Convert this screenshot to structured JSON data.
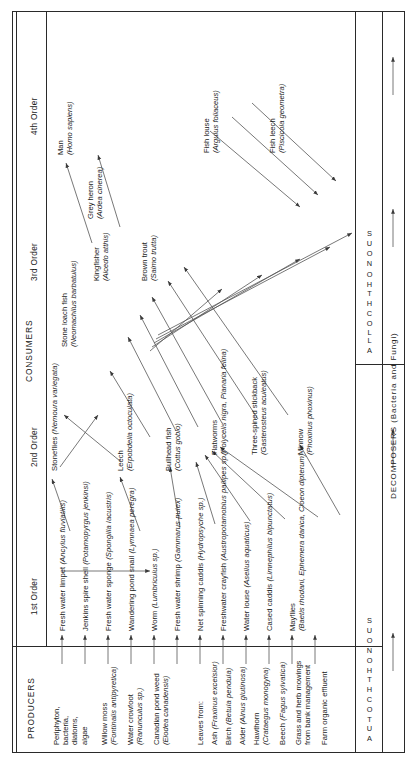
{
  "figure": {
    "bands": {
      "producers": "PRODUCERS",
      "consumers": "CONSUMERS",
      "decomposers": "DECOMPOSERS (Bacteria and Fungi)"
    },
    "orders": [
      {
        "id": "order1",
        "label": "1st Order"
      },
      {
        "id": "order2",
        "label": "2nd Order"
      },
      {
        "id": "order3",
        "label": "3rd Order"
      },
      {
        "id": "order4",
        "label": "4th Order"
      }
    ],
    "spines": [
      {
        "id": "autochthonous",
        "letters": "AUTOCHTHONOUS"
      },
      {
        "id": "allochthonous",
        "letters": "ALLOCHTHONOUS"
      }
    ]
  },
  "producers": {
    "autochthonous": [
      {
        "common": "Periphyton,",
        "extra": [
          "bacteria,",
          "diatoms,",
          "algae"
        ],
        "latin": ""
      },
      {
        "common": "Willow moss",
        "latin": "(Fontinalis antipyretica)"
      },
      {
        "common": "Water crowfoot",
        "latin": "(Ranunculus sp.)"
      },
      {
        "common": "Canadian pond weed",
        "latin": "(Elodea canadensis)"
      }
    ],
    "allochthonous": [
      {
        "common": "Leaves from:",
        "latin": ""
      },
      {
        "common": "Ash",
        "latin": "(Fraxinus excelsior)"
      },
      {
        "common": "Birch",
        "latin": "(Betula pendula)"
      },
      {
        "common": "Alder",
        "latin": "(Alnus glutinosa)"
      },
      {
        "common": "Hawthorn",
        "latin": "(Crataegus monogyna)"
      },
      {
        "common": "Beech",
        "latin": "(Fagus sylvatica)"
      },
      {
        "common": "Grass and herb mowings",
        "extra": [
          "from bank management"
        ],
        "latin": ""
      },
      {
        "common": "Farm organic effluent",
        "latin": ""
      }
    ]
  },
  "consumers": {
    "first_order": [
      {
        "common": "Fresh water limpet",
        "latin": "(Ancylus fluviatilis)"
      },
      {
        "common": "Jenkins spire shell",
        "latin": "(Potamopyrgus jenkinsi)"
      },
      {
        "common": "Fresh water sponge",
        "latin": "(Spongilla lacustris)"
      },
      {
        "common": "Wandering pond snail",
        "latin": "(Lymnaea peregra)"
      },
      {
        "common": "Worm",
        "latin": "(Lumbriculus sp.)"
      },
      {
        "common": "Fresh water shrimp",
        "latin": "(Gammarus pulex)"
      },
      {
        "common": "Net spinning caddis",
        "latin": "(Hydropsyche sp.)"
      },
      {
        "common": "Freshwater crayfish",
        "latin": "(Austropotamobius pallipes sp.)"
      },
      {
        "common": "Water louse",
        "latin": "(Asellus aquaticus)"
      },
      {
        "common": "Cased caddis",
        "latin": "(Limnephilus bipunctatus)"
      },
      {
        "common": "Mayflies",
        "latin": "(Baetis rhodani, Ephemera danica, Cloeon dipterum)"
      }
    ],
    "second_order": [
      {
        "common": "Stoneflies",
        "latin": "(Nemoura variegata)"
      },
      {
        "common": "Leech",
        "latin": "(Erpobdella octoculata)"
      },
      {
        "common": "Bullhead fish",
        "latin": "(Cottus gobio)"
      },
      {
        "common": "Flatworms",
        "latin": "(Polycelis nigra, Planaria felina)"
      },
      {
        "common": "Three-spined stickback",
        "latin": "(Gasterosteus aculeatus)"
      },
      {
        "common": "Minnow",
        "latin": "(Phoxinus phoxinus)"
      }
    ],
    "third_order": [
      {
        "common": "Stone loach fish",
        "latin": "(Neomachilus barbatulus)"
      },
      {
        "common": "Kingfisher",
        "latin": "(Alcedo atthis)"
      },
      {
        "common": "Brown trout",
        "latin": "(Salmo trutta)"
      },
      {
        "common": "Grey heron",
        "latin": "(Ardea cinerea)"
      },
      {
        "common": "Fish louse",
        "latin": "(Argulus foliaceus)"
      },
      {
        "common": "Fish leech",
        "latin": "(Piscicola geometra)"
      }
    ],
    "fourth_order": [
      {
        "common": "Man",
        "latin": "(Homo sapiens)"
      }
    ]
  },
  "colors": {
    "ink": "#2a2a2a",
    "line": "#555555",
    "background": "#ffffff"
  }
}
